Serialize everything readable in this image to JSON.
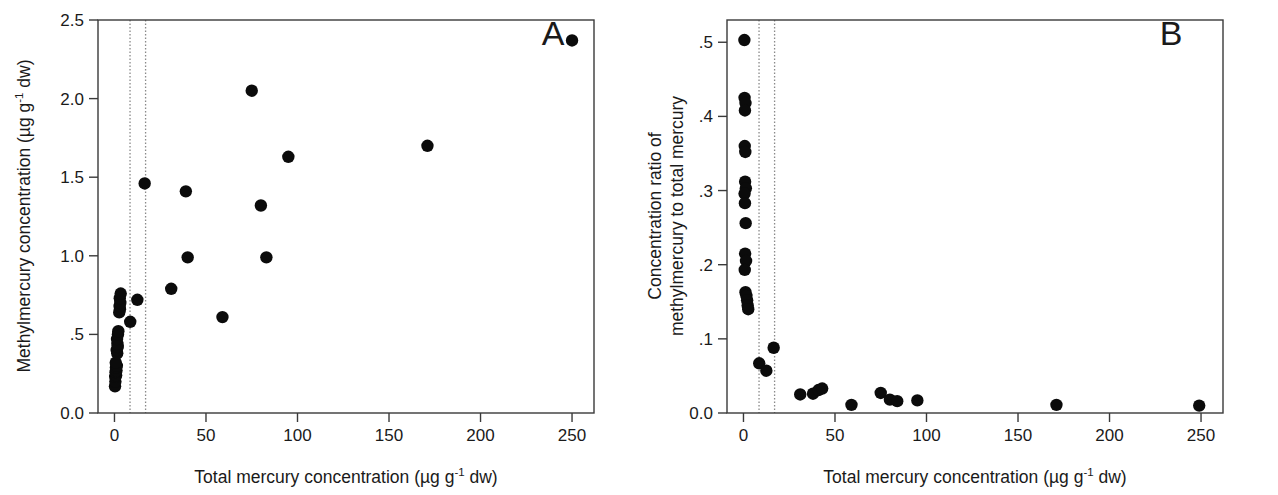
{
  "figure": {
    "background": "#ffffff",
    "point_color": "#0b0b0b",
    "axis_color": "#3a3a3a",
    "guide_color": "#8a8a8a"
  },
  "panels": [
    {
      "id": "A",
      "label": "A",
      "xlabel_main": "Total mercury concentration (µg g",
      "xlabel_sup": "-1",
      "xlabel_tail": " dw)",
      "ylabel_main": "Methylmercury concentration (µg g",
      "ylabel_sup": "-1",
      "ylabel_tail": " dw)",
      "xticks": [
        "0",
        "50",
        "100",
        "150",
        "200",
        "250"
      ],
      "yticks": [
        "0.0",
        ".5",
        "1.0",
        "1.5",
        "2.0",
        "2.5"
      ]
    },
    {
      "id": "B",
      "label": "B",
      "xlabel_main": "Total mercury concentration (µg g",
      "xlabel_sup": "-1",
      "xlabel_tail": " dw)",
      "ylabel_line1": "Concentration ratio of",
      "ylabel_line2": "methylmercury to total mercury",
      "xticks": [
        "0",
        "50",
        "100",
        "150",
        "200",
        "250"
      ],
      "yticks": [
        "0.0",
        ".1",
        ".2",
        ".3",
        ".4",
        ".5"
      ]
    }
  ],
  "chart_data": [
    {
      "type": "scatter",
      "panel": "A",
      "title": "A",
      "xlabel": "Total mercury concentration (µg g-1 dw)",
      "ylabel": "Methylmercury concentration (µg g-1 dw)",
      "xlim": [
        -9,
        262
      ],
      "ylim": [
        0.0,
        2.5
      ],
      "xticks": [
        0,
        50,
        100,
        150,
        200,
        250
      ],
      "yticks": [
        0.0,
        0.5,
        1.0,
        1.5,
        2.0,
        2.5
      ],
      "grid": false,
      "legend": null,
      "vertical_reference_lines": [
        8.5,
        17.0
      ],
      "points": [
        {
          "x": 0.3,
          "y": 0.17
        },
        {
          "x": 0.5,
          "y": 0.2
        },
        {
          "x": 0.4,
          "y": 0.23
        },
        {
          "x": 0.9,
          "y": 0.24
        },
        {
          "x": 0.6,
          "y": 0.26
        },
        {
          "x": 1.1,
          "y": 0.27
        },
        {
          "x": 0.8,
          "y": 0.29
        },
        {
          "x": 1.3,
          "y": 0.3
        },
        {
          "x": 0.7,
          "y": 0.32
        },
        {
          "x": 1.5,
          "y": 0.38
        },
        {
          "x": 1.2,
          "y": 0.4
        },
        {
          "x": 1.8,
          "y": 0.42
        },
        {
          "x": 1.6,
          "y": 0.44
        },
        {
          "x": 1.4,
          "y": 0.47
        },
        {
          "x": 1.9,
          "y": 0.5
        },
        {
          "x": 2.1,
          "y": 0.52
        },
        {
          "x": 2.6,
          "y": 0.64
        },
        {
          "x": 3.0,
          "y": 0.66
        },
        {
          "x": 2.8,
          "y": 0.68
        },
        {
          "x": 3.2,
          "y": 0.7
        },
        {
          "x": 2.9,
          "y": 0.73
        },
        {
          "x": 3.4,
          "y": 0.76
        },
        {
          "x": 8.6,
          "y": 0.58
        },
        {
          "x": 12.5,
          "y": 0.72
        },
        {
          "x": 16.5,
          "y": 1.46
        },
        {
          "x": 31.0,
          "y": 0.79
        },
        {
          "x": 39.0,
          "y": 1.41
        },
        {
          "x": 40.0,
          "y": 0.99
        },
        {
          "x": 59.0,
          "y": 0.61
        },
        {
          "x": 75.0,
          "y": 2.05
        },
        {
          "x": 80.0,
          "y": 1.32
        },
        {
          "x": 83.0,
          "y": 0.99
        },
        {
          "x": 95.0,
          "y": 1.63
        },
        {
          "x": 171.0,
          "y": 1.7
        },
        {
          "x": 250.0,
          "y": 2.37
        }
      ]
    },
    {
      "type": "scatter",
      "panel": "B",
      "title": "B",
      "xlabel": "Total mercury concentration (µg g-1 dw)",
      "ylabel": "Concentration ratio of methylmercury to total mercury",
      "xlim": [
        -9,
        262
      ],
      "ylim": [
        0.0,
        0.53
      ],
      "xticks": [
        0,
        50,
        100,
        150,
        200,
        250
      ],
      "yticks": [
        0.0,
        0.1,
        0.2,
        0.3,
        0.4,
        0.5
      ],
      "grid": false,
      "legend": null,
      "vertical_reference_lines": [
        8.5,
        17.0
      ],
      "points": [
        {
          "x": 0.5,
          "y": 0.503
        },
        {
          "x": 0.6,
          "y": 0.425
        },
        {
          "x": 1.1,
          "y": 0.418
        },
        {
          "x": 0.8,
          "y": 0.408
        },
        {
          "x": 0.7,
          "y": 0.36
        },
        {
          "x": 1.0,
          "y": 0.352
        },
        {
          "x": 0.9,
          "y": 0.312
        },
        {
          "x": 1.3,
          "y": 0.303
        },
        {
          "x": 0.6,
          "y": 0.296
        },
        {
          "x": 0.8,
          "y": 0.283
        },
        {
          "x": 1.2,
          "y": 0.256
        },
        {
          "x": 0.9,
          "y": 0.215
        },
        {
          "x": 1.4,
          "y": 0.205
        },
        {
          "x": 0.7,
          "y": 0.193
        },
        {
          "x": 1.1,
          "y": 0.163
        },
        {
          "x": 1.6,
          "y": 0.158
        },
        {
          "x": 2.0,
          "y": 0.152
        },
        {
          "x": 2.3,
          "y": 0.145
        },
        {
          "x": 2.6,
          "y": 0.14
        },
        {
          "x": 8.6,
          "y": 0.067
        },
        {
          "x": 12.5,
          "y": 0.057
        },
        {
          "x": 16.5,
          "y": 0.088
        },
        {
          "x": 31.0,
          "y": 0.025
        },
        {
          "x": 38.0,
          "y": 0.026
        },
        {
          "x": 41.0,
          "y": 0.031
        },
        {
          "x": 43.0,
          "y": 0.033
        },
        {
          "x": 59.0,
          "y": 0.011
        },
        {
          "x": 75.0,
          "y": 0.027
        },
        {
          "x": 80.0,
          "y": 0.018
        },
        {
          "x": 84.0,
          "y": 0.016
        },
        {
          "x": 95.0,
          "y": 0.017
        },
        {
          "x": 171.0,
          "y": 0.011
        },
        {
          "x": 249.0,
          "y": 0.01
        }
      ]
    }
  ]
}
